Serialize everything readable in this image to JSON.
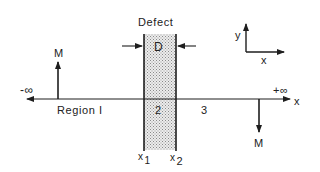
{
  "diagram": {
    "title": "Defect",
    "defect_width_label": "D",
    "axis": {
      "left_end_label": "-∞",
      "right_end_label": "+∞",
      "axis_label": "x"
    },
    "regions": [
      {
        "id": "region-1",
        "label": "Region I"
      },
      {
        "id": "region-2",
        "label": "2"
      },
      {
        "id": "region-3",
        "label": "3"
      }
    ],
    "boundaries": [
      {
        "id": "x1",
        "base": "x",
        "subscript": "1"
      },
      {
        "id": "x2",
        "base": "x",
        "subscript": "2"
      }
    ],
    "magnetization": [
      {
        "id": "left",
        "label": "M",
        "direction": "up"
      },
      {
        "id": "right",
        "label": "M",
        "direction": "down"
      }
    ],
    "coordinate_frame": {
      "x_label": "x",
      "y_label": "y"
    },
    "colors": {
      "line": "#1e1e1e",
      "defect_fill": "#d8d8d8",
      "background": "#ffffff"
    }
  }
}
